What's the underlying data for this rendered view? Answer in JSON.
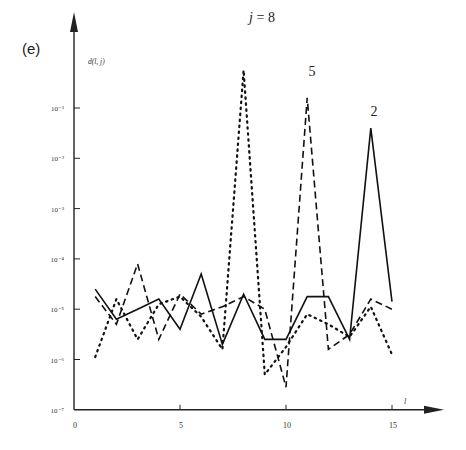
{
  "panel_label": "(e)",
  "chart_data": {
    "type": "line",
    "title": "",
    "xlabel": "l",
    "ylabel": "d(l, j)",
    "yscale": "log",
    "ylim": [
      1e-07,
      1
    ],
    "xlim": [
      0,
      16
    ],
    "x_ticks": [
      0,
      5,
      10,
      15
    ],
    "x_tick_labels": [
      "0",
      "5",
      "10",
      "15"
    ],
    "y_ticks": [
      -1,
      -2,
      -3,
      -4,
      -5,
      -6,
      -7
    ],
    "y_tick_labels": [
      "10⁻¹",
      "10⁻²",
      "10⁻³",
      "10⁻⁴",
      "10⁻⁵",
      "10⁻⁶",
      "10⁻⁷"
    ],
    "grid": false,
    "legend": "none (curves annotated inline)",
    "x": [
      1,
      2,
      3,
      4,
      5,
      6,
      7,
      8,
      9,
      10,
      11,
      12,
      13,
      14,
      15
    ],
    "series": [
      {
        "name": "j = 2",
        "style": "solid",
        "annotation": "2",
        "log10_values": [
          -4.6,
          -5.2,
          -5.0,
          -4.8,
          -5.4,
          -4.3,
          -5.7,
          -4.7,
          -5.6,
          -5.6,
          -4.75,
          -4.75,
          -5.6,
          -1.4,
          -4.85
        ]
      },
      {
        "name": "j = 5",
        "style": "dashed",
        "annotation": "5",
        "log10_values": [
          -4.75,
          -5.3,
          -4.1,
          -5.6,
          -4.7,
          -5.1,
          -4.95,
          -4.75,
          -5.0,
          -6.55,
          -0.8,
          -5.8,
          -5.5,
          -4.8,
          -5.0
        ]
      },
      {
        "name": "j = 8",
        "style": "dotted",
        "annotation": "j = 8",
        "log10_values": [
          -5.95,
          -4.8,
          -5.6,
          -4.9,
          -4.75,
          -5.15,
          -5.8,
          -0.25,
          -6.3,
          -5.75,
          -5.1,
          -5.3,
          -5.55,
          -4.95,
          -5.9
        ]
      }
    ]
  }
}
